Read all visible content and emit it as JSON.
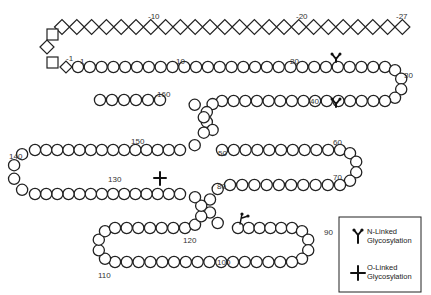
{
  "diagram": {
    "colors": {
      "stroke": "#222222",
      "fill": "#ffffff",
      "text": "#333333"
    },
    "signal_peptide": {
      "shape": "diamond",
      "range": [
        -27,
        -1
      ],
      "labels": [
        {
          "text": "-10",
          "x": 148,
          "y": 19
        },
        {
          "text": "-20",
          "x": 296,
          "y": 19
        },
        {
          "text": "-27",
          "x": 396,
          "y": 19
        },
        {
          "text": "-1",
          "x": 66,
          "y": 61
        }
      ]
    },
    "mature_chain": {
      "shape": "circle",
      "labels": [
        {
          "text": "1",
          "x": 80,
          "y": 64
        },
        {
          "text": "10",
          "x": 176,
          "y": 64
        },
        {
          "text": "20",
          "x": 290,
          "y": 64
        },
        {
          "text": "30",
          "x": 404,
          "y": 78
        },
        {
          "text": "40",
          "x": 310,
          "y": 104
        },
        {
          "text": "50",
          "x": 218,
          "y": 156
        },
        {
          "text": "60",
          "x": 333,
          "y": 145
        },
        {
          "text": "70",
          "x": 333,
          "y": 180
        },
        {
          "text": "80",
          "x": 217,
          "y": 189
        },
        {
          "text": "90",
          "x": 324,
          "y": 235
        },
        {
          "text": "100",
          "x": 217,
          "y": 265
        },
        {
          "text": "110",
          "x": 98,
          "y": 278
        },
        {
          "text": "120",
          "x": 183,
          "y": 243
        },
        {
          "text": "130",
          "x": 108,
          "y": 182
        },
        {
          "text": "140",
          "x": 9,
          "y": 159
        },
        {
          "text": "150",
          "x": 131,
          "y": 144
        },
        {
          "text": "160",
          "x": 157,
          "y": 97
        }
      ]
    },
    "modifications": [
      {
        "type": "N-Linked Glycosylation",
        "glyph": "Y",
        "x": 336,
        "y": 67
      },
      {
        "type": "N-Linked Glycosylation",
        "glyph": "Y",
        "x": 336,
        "y": 112
      },
      {
        "type": "N-Linked Glycosylation",
        "glyph": "branched",
        "x": 242,
        "y": 214
      },
      {
        "type": "O-Linked Glycosylation",
        "glyph": "+",
        "x": 160,
        "y": 180
      }
    ],
    "legend": {
      "items": [
        {
          "icon": "n-linked-glycosylation-icon",
          "line1": "N-Linked",
          "line2": "Glycosylation"
        },
        {
          "icon": "o-linked-glycosylation-icon",
          "line1": "O-Linked",
          "line2": "Glycosylation"
        }
      ]
    }
  }
}
